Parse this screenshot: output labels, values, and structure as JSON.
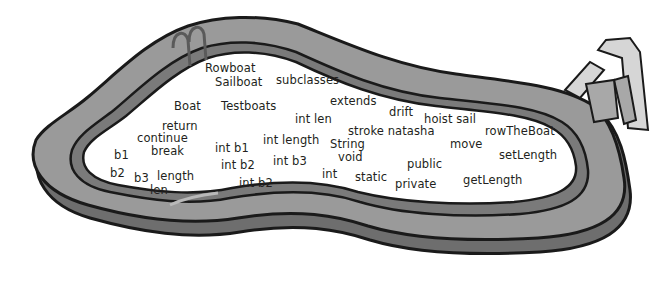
{
  "scene": {
    "description": "Cartoon swimming pool containing scattered Java code snippet words",
    "colors": {
      "background": "#ffffff",
      "pool_deck": "#9a9a9a",
      "pool_wall": "#6e6e6e",
      "outline": "#1a1a1a",
      "text": "#231f20",
      "slide_light": "#d6d6d6",
      "slide_mid": "#a8a8a8"
    }
  },
  "words": [
    {
      "text": "Rowboat",
      "x": 205,
      "y": 63
    },
    {
      "text": "Sailboat",
      "x": 215,
      "y": 77
    },
    {
      "text": "subclasses",
      "x": 276,
      "y": 75
    },
    {
      "text": "Boat",
      "x": 174,
      "y": 101
    },
    {
      "text": "Testboats",
      "x": 221,
      "y": 101
    },
    {
      "text": "extends",
      "x": 330,
      "y": 96
    },
    {
      "text": "int len",
      "x": 295,
      "y": 114
    },
    {
      "text": "drift",
      "x": 389,
      "y": 107
    },
    {
      "text": "hoist sail",
      "x": 424,
      "y": 114
    },
    {
      "text": "return",
      "x": 162,
      "y": 121
    },
    {
      "text": "int length",
      "x": 263,
      "y": 135
    },
    {
      "text": "stroke natasha",
      "x": 348,
      "y": 126
    },
    {
      "text": "rowTheBoat",
      "x": 485,
      "y": 126
    },
    {
      "text": "continue",
      "x": 137,
      "y": 133
    },
    {
      "text": "String",
      "x": 330,
      "y": 139
    },
    {
      "text": "move",
      "x": 450,
      "y": 139
    },
    {
      "text": "b1",
      "x": 114,
      "y": 150
    },
    {
      "text": "break",
      "x": 151,
      "y": 146
    },
    {
      "text": "int b1",
      "x": 215,
      "y": 143
    },
    {
      "text": "int b3",
      "x": 273,
      "y": 156
    },
    {
      "text": "void",
      "x": 338,
      "y": 152
    },
    {
      "text": "setLength",
      "x": 499,
      "y": 150
    },
    {
      "text": "int b2",
      "x": 221,
      "y": 160
    },
    {
      "text": "public",
      "x": 407,
      "y": 159
    },
    {
      "text": "b2",
      "x": 110,
      "y": 168
    },
    {
      "text": "b3",
      "x": 134,
      "y": 173
    },
    {
      "text": "length",
      "x": 157,
      "y": 171
    },
    {
      "text": "int",
      "x": 322,
      "y": 169
    },
    {
      "text": "static",
      "x": 355,
      "y": 172
    },
    {
      "text": "getLength",
      "x": 463,
      "y": 175
    },
    {
      "text": "int b2",
      "x": 239,
      "y": 178
    },
    {
      "text": "private",
      "x": 395,
      "y": 179
    },
    {
      "text": "len",
      "x": 150,
      "y": 185
    }
  ]
}
